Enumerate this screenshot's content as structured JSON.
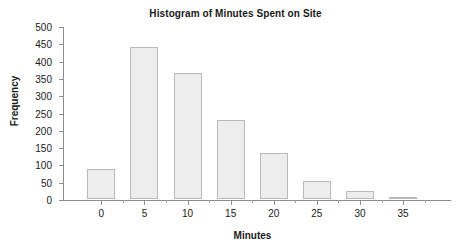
{
  "chart_data": {
    "type": "bar",
    "title": "Histogram of Minutes Spent on Site",
    "xlabel": "Minutes",
    "ylabel": "Frequency",
    "categories": [
      "0",
      "5",
      "10",
      "15",
      "20",
      "25",
      "30",
      "35"
    ],
    "values": [
      88,
      438,
      365,
      228,
      132,
      52,
      23,
      3
    ],
    "ylim": [
      0,
      500
    ],
    "ytick_step": 50,
    "yticks": [
      "0",
      "50",
      "100",
      "150",
      "200",
      "250",
      "300",
      "350",
      "400",
      "450",
      "500"
    ],
    "xticks": [
      "0",
      "5",
      "10",
      "15",
      "20",
      "25",
      "30",
      "35"
    ],
    "grid": false,
    "legend": "none",
    "series": [
      {
        "name": "Frequency",
        "values": [
          88,
          438,
          365,
          228,
          132,
          52,
          23,
          3
        ]
      }
    ],
    "style": {
      "bar_fill": "#ededed",
      "bar_border": "#b9b9b9",
      "axis_color": "#8d8d8d",
      "text_color": "#1a1a1a",
      "background": "#ffffff"
    }
  }
}
